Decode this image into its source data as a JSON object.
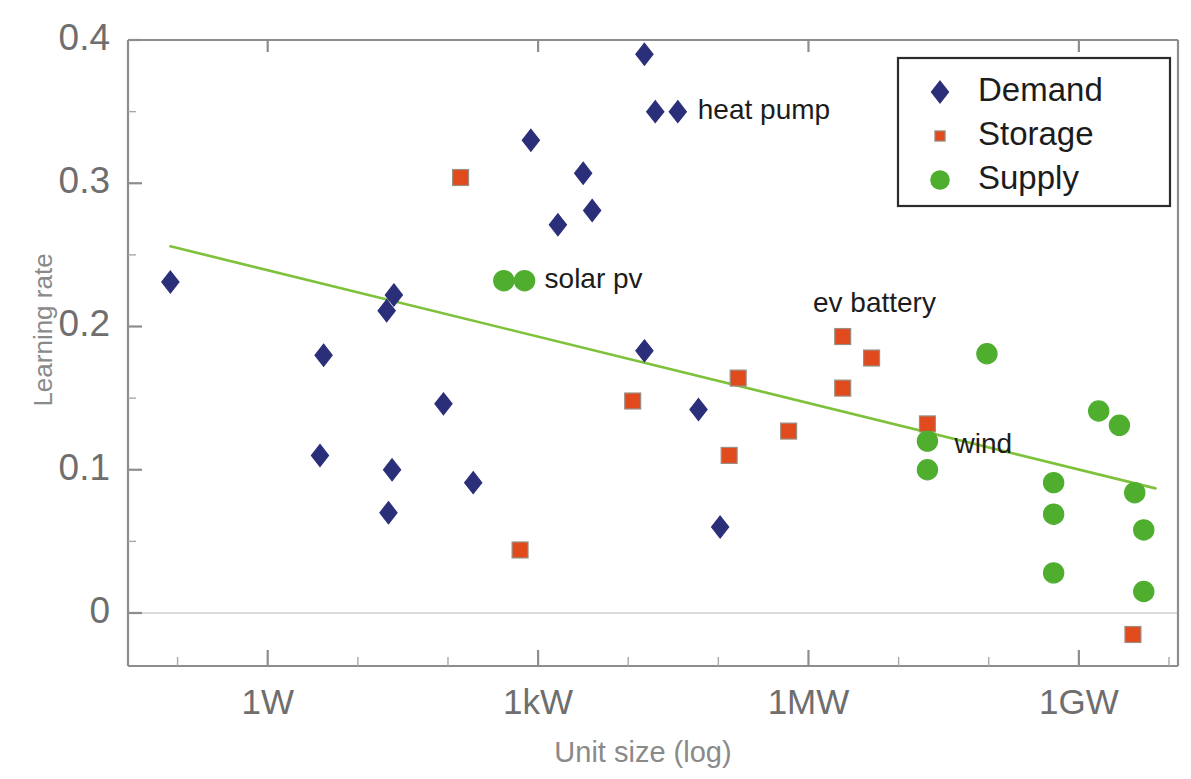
{
  "chart_data": {
    "type": "scatter",
    "title": "",
    "xlabel": "Unit size (log)",
    "ylabel": "Learning rate",
    "xscale": "log",
    "x_tick_labels": [
      "1W",
      "1kW",
      "1MW",
      "1GW"
    ],
    "x_tick_values": [
      1,
      1000,
      1000000,
      1000000000
    ],
    "y_tick_labels": [
      "0",
      "0.1",
      "0.2",
      "0.3",
      "0.4"
    ],
    "y_tick_values": [
      0,
      0.1,
      0.2,
      0.3,
      0.4
    ],
    "ylim": [
      -0.03,
      0.41
    ],
    "xlim_log10": [
      -1.55,
      10.1
    ],
    "grid": false,
    "legend_position": "top-right",
    "legend": [
      {
        "label": "Demand",
        "marker": "diamond",
        "color": "#2b2f7a"
      },
      {
        "label": "Storage",
        "marker": "square",
        "color": "#e04a1d"
      },
      {
        "label": "Supply",
        "marker": "circle",
        "color": "#4fae2e"
      }
    ],
    "series": [
      {
        "name": "Demand",
        "marker": "diamond",
        "color": "#2b2f7a",
        "points": [
          {
            "x_log10": -1.08,
            "y": 0.231
          },
          {
            "x_log10": 0.62,
            "y": 0.18
          },
          {
            "x_log10": 1.32,
            "y": 0.211
          },
          {
            "x_log10": 1.4,
            "y": 0.222
          },
          {
            "x_log10": 1.38,
            "y": 0.1
          },
          {
            "x_log10": 1.34,
            "y": 0.07
          },
          {
            "x_log10": 0.58,
            "y": 0.11
          },
          {
            "x_log10": 1.95,
            "y": 0.146
          },
          {
            "x_log10": 2.28,
            "y": 0.091
          },
          {
            "x_log10": 2.92,
            "y": 0.33
          },
          {
            "x_log10": 3.22,
            "y": 0.271
          },
          {
            "x_log10": 3.5,
            "y": 0.307
          },
          {
            "x_log10": 3.6,
            "y": 0.281
          },
          {
            "x_log10": 4.18,
            "y": 0.39
          },
          {
            "x_log10": 4.3,
            "y": 0.35
          },
          {
            "x_log10": 4.18,
            "y": 0.183
          },
          {
            "x_log10": 4.78,
            "y": 0.142
          },
          {
            "x_log10": 5.02,
            "y": 0.06
          }
        ]
      },
      {
        "name": "Storage",
        "marker": "square",
        "color": "#e04a1d",
        "points": [
          {
            "x_log10": 2.14,
            "y": 0.304
          },
          {
            "x_log10": 2.8,
            "y": 0.044
          },
          {
            "x_log10": 4.05,
            "y": 0.148
          },
          {
            "x_log10": 5.12,
            "y": 0.11
          },
          {
            "x_log10": 5.22,
            "y": 0.164
          },
          {
            "x_log10": 5.78,
            "y": 0.127
          },
          {
            "x_log10": 6.38,
            "y": 0.193
          },
          {
            "x_log10": 6.7,
            "y": 0.178
          },
          {
            "x_log10": 6.38,
            "y": 0.157
          },
          {
            "x_log10": 7.32,
            "y": 0.132
          },
          {
            "x_log10": 9.6,
            "y": -0.015
          }
        ]
      },
      {
        "name": "Supply",
        "marker": "circle",
        "color": "#4fae2e",
        "points": [
          {
            "x_log10": 2.62,
            "y": 0.232
          },
          {
            "x_log10": 7.32,
            "y": 0.12
          },
          {
            "x_log10": 7.32,
            "y": 0.1
          },
          {
            "x_log10": 7.98,
            "y": 0.181
          },
          {
            "x_log10": 8.72,
            "y": 0.091
          },
          {
            "x_log10": 8.72,
            "y": 0.069
          },
          {
            "x_log10": 8.72,
            "y": 0.028
          },
          {
            "x_log10": 9.22,
            "y": 0.141
          },
          {
            "x_log10": 9.45,
            "y": 0.131
          },
          {
            "x_log10": 9.62,
            "y": 0.084
          },
          {
            "x_log10": 9.72,
            "y": 0.058
          },
          {
            "x_log10": 9.72,
            "y": 0.015
          }
        ]
      }
    ],
    "trendline": {
      "color": "#7ec13a",
      "x_start_log10": -1.08,
      "y_start": 0.256,
      "x_end_log10": 9.85,
      "y_end": 0.087
    },
    "annotations": [
      {
        "text": "heat pump",
        "x_log10": 4.55,
        "y": 0.35,
        "marker": "diamond",
        "color": "#2b2f7a",
        "has_marker": true
      },
      {
        "text": "solar pv",
        "x_log10": 2.85,
        "y": 0.232,
        "marker": "circle",
        "color": "#4fae2e",
        "has_marker": true
      },
      {
        "text": "ev battery",
        "x_log10": 6.05,
        "y": 0.215,
        "has_marker": false
      },
      {
        "text": "wind",
        "x_log10": 7.62,
        "y": 0.117,
        "has_marker": false
      }
    ]
  }
}
